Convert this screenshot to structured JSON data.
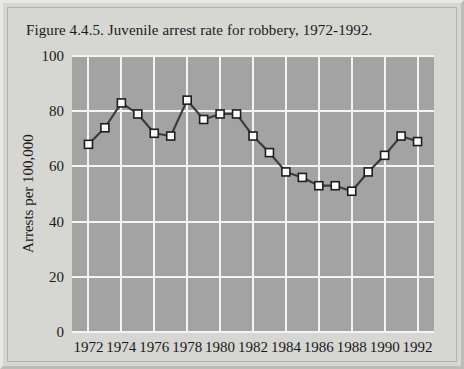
{
  "figure": {
    "title": "Figure 4.4.5. Juvenile arrest rate for robbery, 1972-1992."
  },
  "colors": {
    "panel_background": "#d6d6d2",
    "plot_background": "#a3a3a3",
    "gridline": "#f4f4f0",
    "series_line": "#3c3c3c",
    "marker_fill": "#ffffff",
    "marker_stroke": "#1e1e1e",
    "text": "#1a1a1a"
  },
  "chart_data": {
    "type": "line",
    "title": "Figure 4.4.5. Juvenile arrest rate for robbery, 1972-1992.",
    "xlabel": "",
    "ylabel": "Arrests per 100,000",
    "xlim": [
      1971,
      1993
    ],
    "ylim": [
      0,
      100
    ],
    "grid": true,
    "legend": "none",
    "x_tick_labels": [
      "1972",
      "1974",
      "1976",
      "1978",
      "1980",
      "1982",
      "1984",
      "1986",
      "1988",
      "1990",
      "1992"
    ],
    "x_tick_values": [
      1972,
      1974,
      1976,
      1978,
      1980,
      1982,
      1984,
      1986,
      1988,
      1990,
      1992
    ],
    "y_tick_labels": [
      "0",
      "20",
      "40",
      "60",
      "80",
      "100"
    ],
    "y_tick_values": [
      0,
      20,
      40,
      60,
      80,
      100
    ],
    "x": [
      1972,
      1973,
      1974,
      1975,
      1976,
      1977,
      1978,
      1979,
      1980,
      1981,
      1982,
      1983,
      1984,
      1985,
      1986,
      1987,
      1988,
      1989,
      1990,
      1991,
      1992
    ],
    "values": [
      68,
      74,
      83,
      79,
      72,
      71,
      84,
      77,
      79,
      79,
      71,
      65,
      58,
      56,
      53,
      53,
      51,
      58,
      64,
      71,
      69
    ],
    "series": [
      {
        "name": "Juvenile arrest rate for robbery",
        "values": [
          68,
          74,
          83,
          79,
          72,
          71,
          84,
          77,
          79,
          79,
          71,
          65,
          58,
          56,
          53,
          53,
          51,
          58,
          64,
          71,
          69
        ]
      }
    ]
  }
}
